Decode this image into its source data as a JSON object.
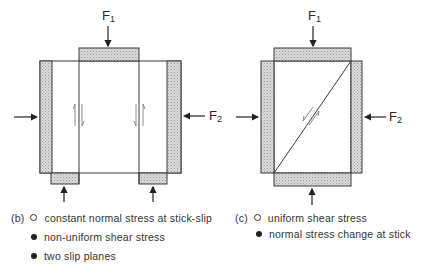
{
  "figure": {
    "panel_b": {
      "force_top": {
        "symbol": "F",
        "sub": "1"
      },
      "force_side": {
        "symbol": "F",
        "sub": "2"
      },
      "caption_tag": "(b)",
      "items": [
        {
          "marker": "open-circle",
          "text": "constant normal stress at stick-slip"
        },
        {
          "marker": "filled-circle",
          "text": "non-uniform shear stress"
        },
        {
          "marker": "filled-circle",
          "text": "two slip planes"
        }
      ]
    },
    "panel_c": {
      "force_top": {
        "symbol": "F",
        "sub": "1"
      },
      "force_side": {
        "symbol": "F",
        "sub": "2"
      },
      "caption_tag": "(c)",
      "items": [
        {
          "marker": "open-circle",
          "text": "uniform shear stress"
        },
        {
          "marker": "filled-circle",
          "text": "normal stress change at stick"
        }
      ]
    },
    "colors": {
      "line": "#2a2a2a",
      "platen_fill": "#cfcfcf",
      "platen_stroke": "#4a4a4a"
    }
  }
}
